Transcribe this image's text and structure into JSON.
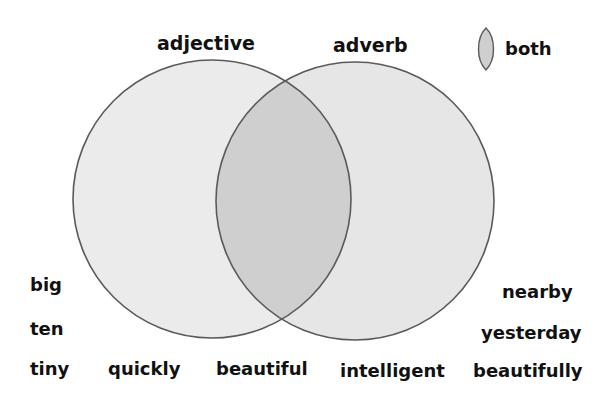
{
  "titles": {
    "left": "adjective",
    "right": "adverb"
  },
  "legend": {
    "label": "both",
    "icon": "lens-shape-icon"
  },
  "colors": {
    "circle_fill": "#ebebeb",
    "overlap_fill": "#cfcfcf",
    "stroke": "#5a5a5a"
  },
  "words": {
    "left_column": [
      "big",
      "ten",
      "tiny"
    ],
    "right_column": [
      "nearby",
      "yesterday",
      "beautifully"
    ],
    "bottom_row": [
      "quickly",
      "beautiful",
      "intelligent"
    ]
  }
}
